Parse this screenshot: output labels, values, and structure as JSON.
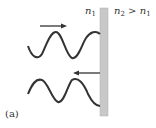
{
  "diagram": {
    "caption": "(a)",
    "medium_left": {
      "symbol": "n",
      "subscript": "1"
    },
    "medium_right": {
      "symbol": "n",
      "subscript": "2",
      "relation": " > ",
      "compare_symbol": "n",
      "compare_subscript": "1"
    },
    "incident_wave": {
      "direction": "right",
      "description": "incident wave traveling toward boundary"
    },
    "reflected_wave": {
      "direction": "left",
      "description": "reflected wave traveling away from boundary"
    },
    "colors": {
      "wave": "#333333",
      "boundary_fill": "#c8c8c8",
      "boundary_edge": "#a0a0a0",
      "arrow": "#333333"
    }
  }
}
